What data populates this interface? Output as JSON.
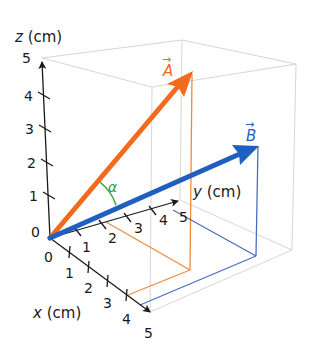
{
  "diagram": {
    "colors": {
      "vector_a": "#f26b1d",
      "vector_b": "#1f5fbf",
      "angle": "#3a9a3a",
      "axis": "#1a1a1a",
      "box": "#d8d8d8",
      "proj_a": "#f08a3c",
      "proj_b": "#4a6fc0"
    },
    "axes": {
      "z": {
        "var": "z",
        "unit": "(cm)",
        "ticks": [
          "0",
          "1",
          "2",
          "3",
          "4",
          "5"
        ]
      },
      "y": {
        "var": "y",
        "unit": "(cm)",
        "ticks": [
          "1",
          "2",
          "3",
          "4",
          "5"
        ]
      },
      "x": {
        "var": "x",
        "unit": "(cm)",
        "ticks": [
          "0",
          "1",
          "2",
          "3",
          "4",
          "5"
        ]
      }
    },
    "vectors": {
      "a": {
        "label": "A",
        "arrow": "→"
      },
      "b": {
        "label": "B",
        "arrow": "→"
      }
    },
    "angle_label": "α"
  }
}
